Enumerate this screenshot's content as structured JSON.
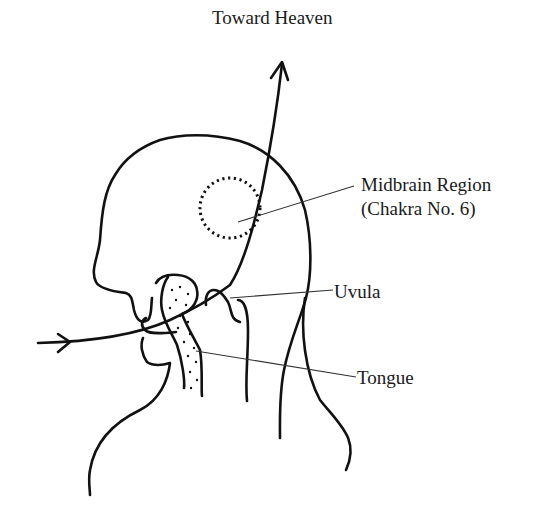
{
  "diagram": {
    "type": "anatomical-illustration",
    "labels": {
      "top": "Toward Heaven",
      "midbrain_line1": "Midbrain Region",
      "midbrain_line2": "(Chakra No. 6)",
      "uvula": "Uvula",
      "tongue": "Tongue"
    },
    "colors": {
      "ink": "#111111",
      "background": "#ffffff"
    }
  }
}
